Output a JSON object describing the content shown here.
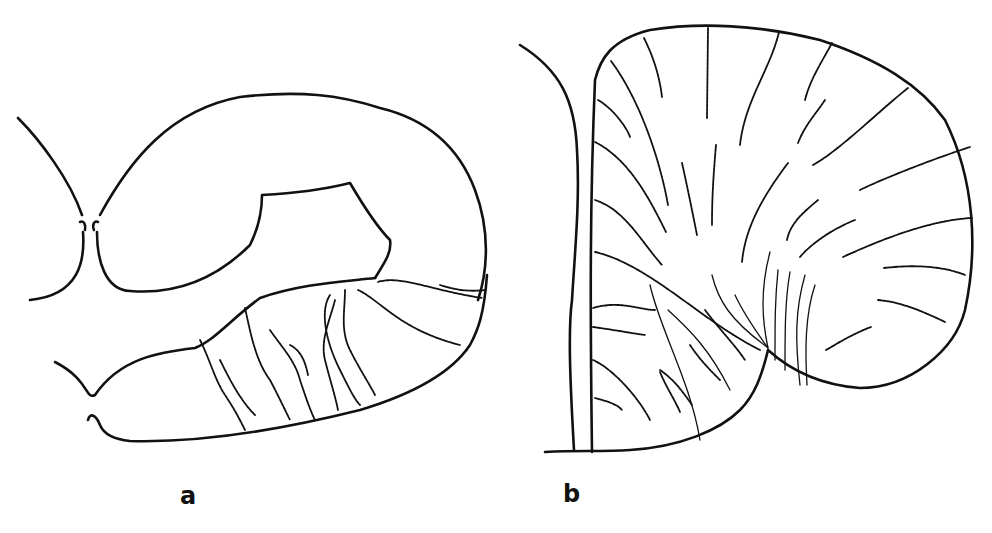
{
  "figure": {
    "panels": [
      {
        "id": "a",
        "label": "a",
        "description": "Cross-section outline with vascular branching in lower region"
      },
      {
        "id": "b",
        "label": "b",
        "description": "Rounded section with radial vessel lines converging toward notch"
      }
    ],
    "colors": {
      "line": "#111111",
      "background": "#ffffff"
    }
  }
}
